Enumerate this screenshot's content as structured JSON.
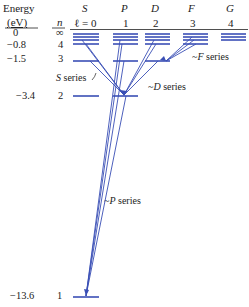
{
  "header": {
    "energy_label": "Energy",
    "unit_label": "(eV)",
    "n_label": "n",
    "l_label": "ℓ = 0"
  },
  "columns": [
    {
      "symbol": "S",
      "l": "ℓ = 0"
    },
    {
      "symbol": "P",
      "l": "1"
    },
    {
      "symbol": "D",
      "l": "2"
    },
    {
      "symbol": "F",
      "l": "3"
    },
    {
      "symbol": "G",
      "l": "4"
    }
  ],
  "levels": [
    {
      "energy": "0",
      "n": "∞"
    },
    {
      "energy": "−0.8",
      "n": "4"
    },
    {
      "energy": "−1.5",
      "n": "3"
    },
    {
      "energy": "−3.4",
      "n": "2"
    },
    {
      "energy": "−13.6",
      "n": "1"
    }
  ],
  "series_labels": {
    "s": "S series",
    "p": "P series",
    "d": "D series",
    "f": "F series"
  },
  "colors": {
    "level": "#3a4fb5",
    "transition": "#3a4fb5",
    "text": "#222222"
  }
}
